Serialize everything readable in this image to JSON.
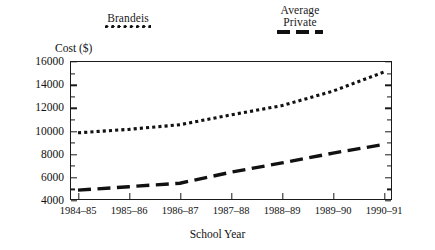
{
  "chart_data": {
    "type": "line",
    "title": "",
    "xlabel": "School Year",
    "ylabel": "Cost ($)",
    "categories": [
      "1984–85",
      "1985–86",
      "1986–87",
      "1987–88",
      "1988–89",
      "1989–90",
      "1990–91"
    ],
    "ylim": [
      4000,
      16000
    ],
    "ytick_values": [
      4000,
      6000,
      8000,
      10000,
      12000,
      14000,
      16000
    ],
    "ytick_labels": [
      "4000",
      "6000",
      "8000",
      "10000",
      "12000",
      "14000",
      "16000"
    ],
    "ytick_minor_step": 1000,
    "grid": false,
    "legend_position": "above-plot",
    "series": [
      {
        "name": "Brandeis",
        "style": "dotted",
        "color": "#111111",
        "values": [
          9800,
          10100,
          10500,
          11350,
          12150,
          13400,
          15050
        ]
      },
      {
        "name": "Average\nPrivate",
        "style": "dashed",
        "color": "#111111",
        "values": [
          4850,
          5150,
          5450,
          6400,
          7200,
          8050,
          8800
        ]
      }
    ]
  },
  "legend": {
    "brandeis": {
      "label": "Brandeis",
      "swatch": "dotted-line-swatch"
    },
    "average_private": {
      "label": "Average\nPrivate",
      "swatch": "dashed-line-swatch"
    }
  },
  "axes": {
    "y_title": "Cost ($)",
    "x_title": "School Year"
  }
}
